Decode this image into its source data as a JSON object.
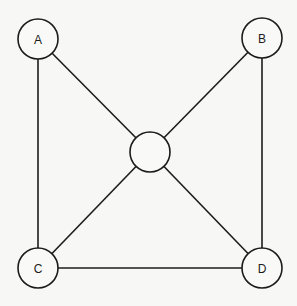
{
  "diagram": {
    "type": "graph",
    "nodes": [
      {
        "id": "A",
        "label": "A"
      },
      {
        "id": "B",
        "label": "B"
      },
      {
        "id": "C",
        "label": "C"
      },
      {
        "id": "D",
        "label": "D"
      },
      {
        "id": "center",
        "label": ""
      }
    ],
    "edges": [
      {
        "from": "A",
        "to": "C"
      },
      {
        "from": "A",
        "to": "center"
      },
      {
        "from": "B",
        "to": "center"
      },
      {
        "from": "B",
        "to": "D"
      },
      {
        "from": "C",
        "to": "center"
      },
      {
        "from": "C",
        "to": "D"
      },
      {
        "from": "D",
        "to": "center"
      }
    ]
  }
}
